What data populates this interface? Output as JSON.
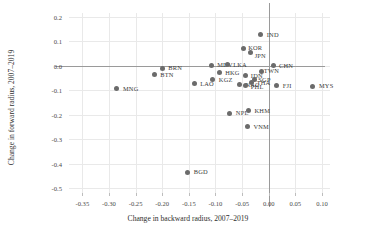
{
  "chart_data": {
    "type": "scatter",
    "title": "",
    "xlabel": "Change in backward radius, 2007–2019",
    "ylabel": "Change in forward radius, 2007–2019",
    "xlim": [
      -0.375,
      0.115
    ],
    "ylim": [
      -0.52,
      0.215
    ],
    "xticks": [
      -0.35,
      -0.3,
      -0.25,
      -0.2,
      -0.15,
      -0.1,
      -0.05,
      0.0,
      0.05,
      0.1
    ],
    "xtick_labels": [
      "-0.35",
      "-0.30",
      "-0.25",
      "-0.20",
      "-0.15",
      "-0.10",
      "-0.05",
      "0.00",
      "0.05",
      "0.10"
    ],
    "yticks": [
      0.2,
      0.1,
      0.0,
      -0.1,
      -0.2,
      -0.3,
      -0.4,
      -0.5
    ],
    "ytick_labels": [
      "0.2",
      "0.1",
      "0.0",
      "-0.1",
      "-0.2",
      "-0.3",
      "-0.4",
      "-0.5"
    ],
    "grid": true,
    "legend": "none",
    "reference_lines": {
      "vertical_x": 0.0,
      "horizontal_y": 0.0
    },
    "marker_color": "#6b6b6b",
    "points": [
      {
        "label": "MNG",
        "x": -0.285,
        "y": -0.095,
        "lx": 6,
        "ly": -3
      },
      {
        "label": "BRN",
        "x": -0.2,
        "y": -0.01,
        "lx": 6,
        "ly": -3
      },
      {
        "label": "BTN",
        "x": -0.215,
        "y": -0.038,
        "lx": 6,
        "ly": -3
      },
      {
        "label": "LAO",
        "x": -0.14,
        "y": -0.073,
        "lx": 6,
        "ly": -3
      },
      {
        "label": "MDV",
        "x": -0.108,
        "y": 0.002,
        "lx": 6,
        "ly": -3
      },
      {
        "label": "LKA",
        "x": -0.078,
        "y": 0.003,
        "lx": 6,
        "ly": -3
      },
      {
        "label": "HKG",
        "x": -0.093,
        "y": -0.028,
        "lx": 6,
        "ly": -3
      },
      {
        "label": "KGZ",
        "x": -0.105,
        "y": -0.058,
        "lx": 6,
        "ly": -3
      },
      {
        "label": "NAC",
        "x": -0.055,
        "y": -0.078,
        "lx": 6,
        "ly": -3
      },
      {
        "label": "NPL",
        "x": -0.073,
        "y": -0.195,
        "lx": 6,
        "ly": -3
      },
      {
        "label": "KHM",
        "x": -0.038,
        "y": -0.185,
        "lx": 6,
        "ly": -3
      },
      {
        "label": "VNM",
        "x": -0.04,
        "y": -0.25,
        "lx": 6,
        "ly": -3
      },
      {
        "label": "BGD",
        "x": -0.152,
        "y": -0.435,
        "lx": 6,
        "ly": -3
      },
      {
        "label": "IND",
        "x": -0.015,
        "y": 0.127,
        "lx": 6,
        "ly": -3
      },
      {
        "label": "KOR",
        "x": -0.048,
        "y": 0.072,
        "lx": 5,
        "ly": -3
      },
      {
        "label": "JPN",
        "x": -0.034,
        "y": 0.055,
        "lx": 4,
        "ly": 1
      },
      {
        "label": "CHN",
        "x": 0.008,
        "y": 0.0,
        "lx": 6,
        "ly": -3
      },
      {
        "label": "TWN",
        "x": -0.013,
        "y": -0.025,
        "lx": 2,
        "ly": -4
      },
      {
        "label": "IDN",
        "x": -0.043,
        "y": -0.042,
        "lx": 5,
        "ly": -3
      },
      {
        "label": "SGP",
        "x": -0.027,
        "y": -0.055,
        "lx": 4,
        "ly": -2
      },
      {
        "label": "THA",
        "x": -0.032,
        "y": -0.068,
        "lx": 5,
        "ly": -2
      },
      {
        "label": "PHL",
        "x": -0.043,
        "y": -0.082,
        "lx": 5,
        "ly": -2
      },
      {
        "label": "FJI",
        "x": 0.015,
        "y": -0.082,
        "lx": 6,
        "ly": -3
      },
      {
        "label": "MYS",
        "x": 0.083,
        "y": -0.085,
        "lx": 6,
        "ly": -3
      }
    ]
  }
}
